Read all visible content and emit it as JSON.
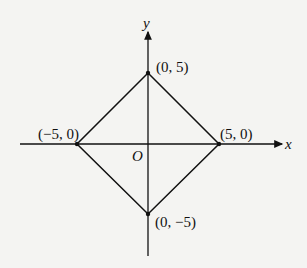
{
  "diagram": {
    "axes": {
      "x_label": "x",
      "y_label": "y",
      "origin_label": "O"
    },
    "vertices": [
      {
        "name": "top",
        "label": "(0, 5)",
        "x": 0,
        "y": 5
      },
      {
        "name": "right",
        "label": "(5, 0)",
        "x": 5,
        "y": 0
      },
      {
        "name": "bottom",
        "label": "(0, −5)",
        "x": 0,
        "y": -5
      },
      {
        "name": "left",
        "label": "(−5, 0)",
        "x": -5,
        "y": 0
      }
    ],
    "shape": "square (diamond) with vertices on axes",
    "colors": {
      "stroke": "#111111",
      "background": "#f4f4f2"
    }
  }
}
